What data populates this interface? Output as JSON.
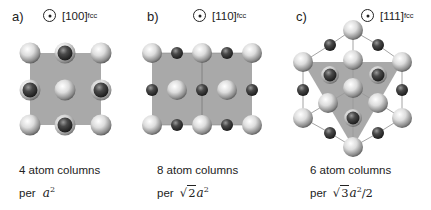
{
  "panels": [
    {
      "id": "a",
      "label": "a)",
      "direction": "[100]",
      "direction_subscript": "fcc",
      "direction_symbol": "out-of-plane-dot-icon",
      "caption_line1": "4 atom columns",
      "caption_prefix": "per",
      "caption_math": "a",
      "caption_exponent": "2"
    },
    {
      "id": "b",
      "label": "b)",
      "direction": "[110]",
      "direction_subscript": "fcc",
      "direction_symbol": "out-of-plane-dot-icon",
      "caption_line1": "8 atom columns",
      "caption_prefix": "per",
      "caption_sqrt": "2",
      "caption_math": "a",
      "caption_exponent": "2"
    },
    {
      "id": "c",
      "label": "c)",
      "direction": "[111]",
      "direction_subscript": "fcc",
      "direction_symbol": "out-of-plane-dot-icon",
      "caption_line1": "6 atom columns",
      "caption_prefix": "per",
      "caption_sqrt": "3",
      "caption_math": "a",
      "caption_exponent": "2",
      "caption_suffix": "/2"
    }
  ],
  "colors": {
    "unit_cell_fill": "#a9a9a9",
    "light_atom": "#e6e6e6",
    "dark_atom": "#3c3c3c",
    "bond_line": "#9a9a9a",
    "text": "#222222"
  }
}
